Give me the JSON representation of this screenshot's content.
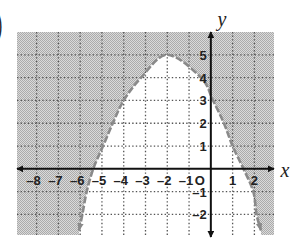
{
  "chart_data": {
    "type": "line",
    "panel_label": ")",
    "title": "",
    "xlabel": "x",
    "ylabel": "y",
    "xlim": [
      -8.9,
      2.9
    ],
    "ylim": [
      -2.9,
      6.0
    ],
    "grid": true,
    "grid_style": "dotted",
    "origin_label": "O",
    "x_ticks": [
      {
        "value": -8,
        "label": "-8"
      },
      {
        "value": -7,
        "label": "-7"
      },
      {
        "value": -6,
        "label": "-6"
      },
      {
        "value": -5,
        "label": "-5"
      },
      {
        "value": -4,
        "label": "-4"
      },
      {
        "value": -3,
        "label": "-3"
      },
      {
        "value": -2,
        "label": "-2"
      },
      {
        "value": -1,
        "label": "-1"
      },
      {
        "value": 1,
        "label": "1"
      },
      {
        "value": 2,
        "label": "2"
      }
    ],
    "y_ticks": [
      {
        "value": 5,
        "label": "5"
      },
      {
        "value": 4,
        "label": "4"
      },
      {
        "value": 3,
        "label": "3"
      },
      {
        "value": 2,
        "label": "2"
      },
      {
        "value": 1,
        "label": "1"
      },
      {
        "value": -1,
        "label": "-1"
      },
      {
        "value": -2,
        "label": "-2"
      }
    ],
    "series": [
      {
        "name": "boundary",
        "line_style": "dashed",
        "arrows_at_ends": true,
        "x": [
          -6.05,
          -5.9,
          -5.7,
          -5.4,
          -4.95,
          -4.5,
          -4.0,
          -3.2,
          -2.0,
          -0.45,
          0.1,
          0.6,
          1.0,
          1.5,
          1.95,
          2.1,
          2.3
        ],
        "y": [
          -2.7,
          -2.0,
          -1.0,
          0.0,
          1.0,
          2.0,
          3.0,
          4.0,
          5.0,
          4.0,
          3.0,
          2.0,
          1.0,
          0.0,
          -1.0,
          -2.0,
          -2.7
        ]
      }
    ],
    "shading": {
      "region": "outside the boundary curve (above it)",
      "shaded_color": "#c4c4c4",
      "unshaded_color": "#ffffff"
    },
    "colors": {
      "axis": "#111111",
      "grid": "#555555",
      "boundary": "#8a8a8a",
      "text": "#222222",
      "stipple_light": "#dadada",
      "stipple_dark": "#ababab"
    }
  }
}
